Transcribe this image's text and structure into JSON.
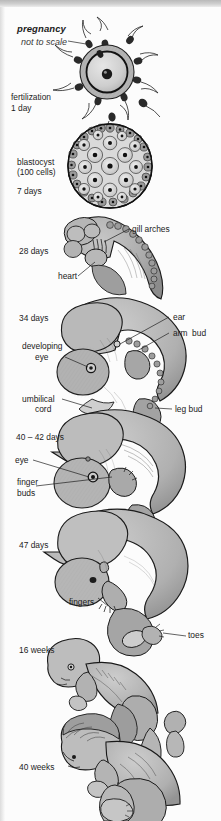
{
  "figure": {
    "title": "pregnancy",
    "subtitle": "not to scale",
    "type": "biological-development-diagram",
    "orientation": "vertical-timeline",
    "colors": {
      "ink": "#1f1f1f",
      "tissue_light": "#c9c9c9",
      "tissue_mid": "#a8a8a8",
      "tissue_dark": "#7d7d7d",
      "background": "#fcfcfc",
      "top_band": "#c5c5c5"
    }
  },
  "stages": [
    {
      "id": "fertilization",
      "stage_label": "fertilization\n1 day",
      "illustration": "ovum-surrounded-by-sperm",
      "callouts": []
    },
    {
      "id": "blastocyst",
      "stage_label": "blastocyst\n(100 cells)",
      "stage_label_2": "7 days",
      "illustration": "blastocyst-cell-ball",
      "callouts": []
    },
    {
      "id": "day28",
      "stage_label": "28 days",
      "illustration": "embryo-28-days",
      "callouts": [
        {
          "text": "gill arches",
          "side": "right"
        },
        {
          "text": "heart",
          "side": "left"
        }
      ]
    },
    {
      "id": "day34",
      "stage_label": "34 days",
      "illustration": "embryo-34-days",
      "callouts": [
        {
          "text": "ear",
          "side": "right"
        },
        {
          "text": "arm  bud",
          "side": "right"
        },
        {
          "text": "developing\neye",
          "side": "left"
        },
        {
          "text": "leg bud",
          "side": "right"
        },
        {
          "text": "umbilical\ncord",
          "side": "left"
        }
      ]
    },
    {
      "id": "day40_42",
      "stage_label": "40 – 42 days",
      "illustration": "embryo-40-42-days",
      "callouts": [
        {
          "text": "eye",
          "side": "left"
        },
        {
          "text": "finger\nbuds",
          "side": "left"
        }
      ]
    },
    {
      "id": "day47",
      "stage_label": "47 days",
      "illustration": "embryo-47-days",
      "callouts": [
        {
          "text": "fingers",
          "side": "left"
        },
        {
          "text": "toes",
          "side": "right"
        }
      ]
    },
    {
      "id": "week16",
      "stage_label": "16 weeks",
      "illustration": "fetus-16-weeks",
      "callouts": []
    },
    {
      "id": "week40",
      "stage_label": "40 weeks",
      "illustration": "fetus-40-weeks",
      "callouts": []
    }
  ],
  "labels": {
    "fertilization_line1": "fertilization",
    "fertilization_line2": "1 day",
    "blastocyst_line1": "blastocyst",
    "blastocyst_line2": "(100 cells)",
    "blastocyst_line3": "7 days",
    "day28": "28 days",
    "gill_arches": "gill arches",
    "heart": "heart",
    "day34": "34 days",
    "ear": "ear",
    "arm_bud": "arm  bud",
    "developing_eye_1": "developing",
    "developing_eye_2": "eye",
    "leg_bud": "leg bud",
    "umbilical_1": "umbilical",
    "umbilical_2": "cord",
    "day40_42": "40 – 42 days",
    "eye": "eye",
    "finger_buds_1": "finger",
    "finger_buds_2": "buds",
    "day47": "47 days",
    "fingers": "fingers",
    "toes": "toes",
    "week16": "16 weeks",
    "week40": "40 weeks"
  }
}
